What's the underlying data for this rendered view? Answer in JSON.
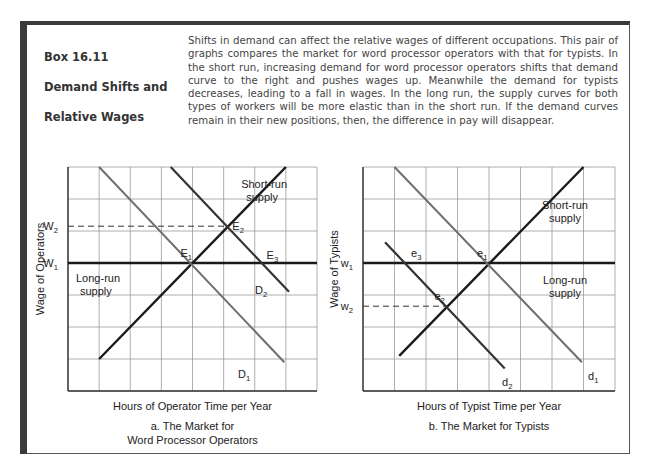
{
  "box": {
    "title_line1": "Box 16.11",
    "title_line2": "Demand Shifts and",
    "title_line3": "Relative Wages",
    "text": "Shifts in demand can affect the relative wages of different occupations. This pair of graphs compares the market for word processor operators with that for typists. In the short run, increasing demand for word processor operators shifts that demand curve to the right and pushes wages up. Meanwhile the demand for typists decreases, leading to a fall in wages. In the long run, the supply curves for both types of workers will be more elastic than in the short run. If the demand curves remain in their new positions, then, the difference in pay will disappear."
  },
  "colors": {
    "border": "#3a3a3a",
    "grid": "#9a9a9a",
    "supply": "#1a1a1a",
    "demand_old": "#6e6e6e",
    "demand_new": "#333333"
  },
  "chart_data": [
    {
      "type": "line",
      "title": "a. The Market for Word Processor Operators",
      "caption_line1": "a.  The Market for",
      "caption_line2": "Word Processor Operators",
      "xlabel": "Hours of Operator Time per Year",
      "ylabel": "Wage of Operators",
      "xlim": [
        0,
        8
      ],
      "ylim": [
        0,
        7
      ],
      "grid": true,
      "y_ticks": [
        {
          "label": "W",
          "sub": "2",
          "y": 5.15
        },
        {
          "label": "W",
          "sub": "1",
          "y": 4
        }
      ],
      "series": [
        {
          "name": "Short-run supply",
          "label_line1": "Short-run",
          "label_line2": "supply",
          "style": "supply",
          "points": [
            [
              1,
              1
            ],
            [
              7,
              7
            ]
          ]
        },
        {
          "name": "Long-run supply",
          "label_line1": "Long-run",
          "label_line2": "supply",
          "style": "supply",
          "points": [
            [
              0,
              4
            ],
            [
              8,
              4
            ]
          ]
        },
        {
          "name": "D1",
          "label": "D",
          "sub": "1",
          "style": "demand_old",
          "points": [
            [
              1,
              7
            ],
            [
              6.95,
              0.9
            ]
          ]
        },
        {
          "name": "D2",
          "label": "D",
          "sub": "2",
          "style": "demand_new",
          "points": [
            [
              3.3,
              7
            ],
            [
              7.1,
              3.1
            ]
          ]
        }
      ],
      "points": [
        {
          "label": "E",
          "sub": "1",
          "x": 4,
          "y": 4
        },
        {
          "label": "E",
          "sub": "2",
          "x": 5.15,
          "y": 5.15
        },
        {
          "label": "E",
          "sub": "3",
          "x": 6.25,
          "y": 4
        }
      ],
      "dashed": [
        {
          "from": [
            0,
            5.15
          ],
          "to": [
            5.15,
            5.15
          ]
        }
      ]
    },
    {
      "type": "line",
      "title": "b. The Market for Typists",
      "caption_line1": "b.  The Market for Typists",
      "xlabel": "Hours of Typist Time per Year",
      "ylabel": "Wage of Typists",
      "xlim": [
        0,
        8
      ],
      "ylim": [
        0,
        7
      ],
      "grid": true,
      "y_ticks": [
        {
          "label": "w",
          "sub": "1",
          "y": 4
        },
        {
          "label": "w",
          "sub": "2",
          "y": 2.65
        }
      ],
      "series": [
        {
          "name": "Short-run supply",
          "label_line1": "Short-run",
          "label_line2": "supply",
          "style": "supply",
          "points": [
            [
              1.15,
              1.1
            ],
            [
              7,
              7
            ]
          ]
        },
        {
          "name": "Long-run supply",
          "label_line1": "Long-run",
          "label_line2": "supply",
          "style": "supply",
          "points": [
            [
              0,
              4
            ],
            [
              8,
              4
            ]
          ]
        },
        {
          "name": "d1",
          "label": "d",
          "sub": "1",
          "style": "demand_old",
          "points": [
            [
              1,
              7
            ],
            [
              6.95,
              0.9
            ]
          ]
        },
        {
          "name": "d2",
          "label": "d",
          "sub": "2",
          "style": "demand_new",
          "points": [
            [
              0.7,
              4.65
            ],
            [
              4.5,
              0.7
            ]
          ]
        }
      ],
      "points": [
        {
          "label": "e",
          "sub": "1",
          "x": 4,
          "y": 4
        },
        {
          "label": "e",
          "sub": "2",
          "x": 2.65,
          "y": 2.65
        },
        {
          "label": "e",
          "sub": "3",
          "x": 1.4,
          "y": 4
        }
      ],
      "dashed": [
        {
          "from": [
            0,
            2.65
          ],
          "to": [
            2.65,
            2.65
          ]
        }
      ]
    }
  ]
}
